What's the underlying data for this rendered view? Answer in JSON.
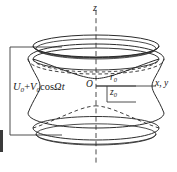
{
  "figure": {
    "width": 177,
    "height": 172,
    "background_color": "#ffffff",
    "line_color": "#2b2b2b",
    "text_color": "#1a1a1a"
  },
  "labels": {
    "voltage_source": {
      "text": "U0 + V0cosΩt",
      "base_u": "U",
      "sub_u": "0",
      "plus": " + ",
      "base_v": "V",
      "sub_v": "0",
      "cos": "cos",
      "omega": "Ω",
      "time": "t"
    },
    "z_axis": "z",
    "xy_axis": "x, y",
    "origin": "O",
    "r0": {
      "base": "r",
      "sub": "0"
    },
    "z0": {
      "base": "z",
      "sub": "0"
    }
  },
  "geometry": {
    "axis_origin_x": 96,
    "axis_origin_y": 86,
    "ring_half_width": 78,
    "r0_extent_px": 40,
    "z0_extent_px": 22,
    "endcap_top_y": 45,
    "endcap_bottom_y": 128,
    "circuit_left_x": 10,
    "circuit_top_y": 47,
    "circuit_bottom_y": 135
  },
  "elements": {
    "upper_endcap": "upper-endcap-electrode",
    "lower_endcap": "lower-endcap-electrode",
    "ring_electrode": "ring-electrode-hyperboloid",
    "z_axis_line": "z-axis-dashed-line",
    "xy_axis_line": "xy-axis-line",
    "circuit_wire": "voltage-source-circuit-wire",
    "r0_dimension": "r0-dimension-line",
    "z0_dimension": "z0-dimension-line"
  }
}
